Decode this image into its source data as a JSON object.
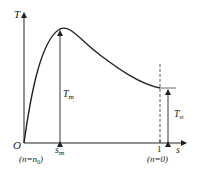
{
  "diagram": {
    "axes": {
      "y_label": "T",
      "x_label": "s",
      "origin_label": "O"
    },
    "annotations": {
      "origin_condition": "(n=n0)",
      "origin_condition_prefix": "(n=n",
      "origin_condition_sub": "0",
      "origin_condition_suffix": ")",
      "peak_torque": "T",
      "peak_torque_sub": "m",
      "peak_slip": "s",
      "peak_slip_sub": "m",
      "starting_torque": "T",
      "starting_torque_sub": "st",
      "unit_slip_tick": "1",
      "unit_slip_condition": "(n=0)"
    },
    "colors": {
      "line": "#222222",
      "background": "#ffffff"
    }
  }
}
